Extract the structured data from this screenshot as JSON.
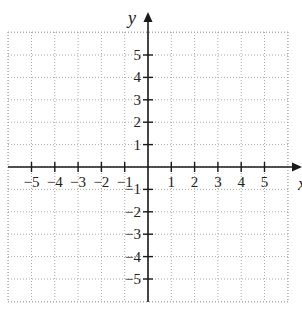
{
  "chart_data": {
    "type": "scatter",
    "title": "",
    "xlabel": "x",
    "ylabel": "y",
    "xlim": [
      -6,
      6
    ],
    "ylim": [
      -6,
      6
    ],
    "grid": true,
    "grid_style": "dotted",
    "x_ticks": [
      -5,
      -4,
      -3,
      -2,
      -1,
      1,
      2,
      3,
      4,
      5
    ],
    "y_ticks": [
      5,
      4,
      3,
      2,
      1,
      -1,
      -2,
      -3,
      -4,
      -5
    ],
    "x_tick_labels": [
      "−5",
      "−4",
      "−3",
      "−2",
      "−1",
      "1",
      "2",
      "3",
      "4",
      "5"
    ],
    "y_tick_labels": [
      "5",
      "4",
      "3",
      "2",
      "1",
      "−1",
      "−2",
      "−3",
      "−4",
      "−5"
    ],
    "series": [],
    "legend": null
  },
  "axes": {
    "y_label": "y",
    "x_label": "x"
  },
  "colors": {
    "axis": "#1a1a1a",
    "grid": "#aaaaaa",
    "background": "#ffffff"
  }
}
